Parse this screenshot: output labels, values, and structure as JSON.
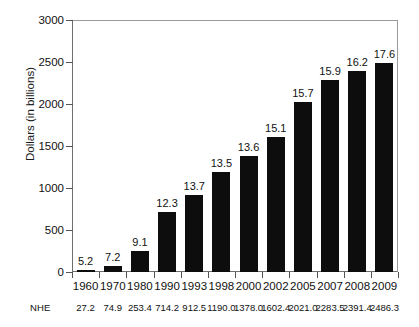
{
  "chart_data": {
    "type": "bar",
    "title": "",
    "subtitle": "",
    "xlabel": "",
    "ylabel": "Dollars (in billions)",
    "ylim": [
      0,
      3000
    ],
    "ytick_labels": [
      "0",
      "500",
      "1000",
      "1500",
      "2000",
      "2500",
      "3000"
    ],
    "ytick_values": [
      0,
      500,
      1000,
      1500,
      2000,
      2500,
      3000
    ],
    "grid": false,
    "legend": null,
    "categories": [
      "1960",
      "1970",
      "1980",
      "1990",
      "1993",
      "1998",
      "2000",
      "2002",
      "2005",
      "2007",
      "2008",
      "2009"
    ],
    "values": [
      27.2,
      74.9,
      253.4,
      714.2,
      912.5,
      1190.0,
      1378.0,
      1602.4,
      2021.0,
      2283.5,
      2391.4,
      2486.3
    ],
    "bar_labels": [
      "5.2",
      "7.2",
      "9.1",
      "12.3",
      "13.7",
      "13.5",
      "13.6",
      "15.1",
      "15.7",
      "15.9",
      "16.2",
      "17.6"
    ],
    "bar_label_values": [
      5.2,
      7.2,
      9.1,
      12.3,
      13.7,
      13.5,
      13.6,
      15.1,
      15.7,
      15.9,
      16.2,
      17.6
    ],
    "bar_color": "#0d0d0d",
    "secondary_row": {
      "label": "NHE",
      "values": [
        "27.2",
        "74.9",
        "253.4",
        "714.2",
        "912.5",
        "1190.0",
        "1378.0",
        "1602.4",
        "2021.0",
        "2283.5",
        "2391.4",
        "2486.3"
      ]
    }
  }
}
